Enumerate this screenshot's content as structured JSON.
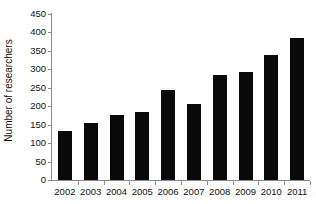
{
  "chart_data": {
    "type": "bar",
    "title": "",
    "subtitle": "",
    "xlabel": "",
    "ylabel": "Number of researchers",
    "categories": [
      "2002",
      "2003",
      "2004",
      "2005",
      "2006",
      "2007",
      "2008",
      "2009",
      "2010",
      "2011"
    ],
    "values": [
      133,
      154,
      175,
      183,
      245,
      206,
      285,
      294,
      340,
      386
    ],
    "series": [
      {
        "name": "Number of researchers",
        "values": [
          133,
          154,
          175,
          183,
          245,
          206,
          285,
          294,
          340,
          386
        ]
      }
    ],
    "ylim": [
      0,
      450
    ],
    "ytick_labels": [
      "0",
      "50",
      "100",
      "150",
      "200",
      "250",
      "300",
      "350",
      "400",
      "450"
    ],
    "ytick_values": [
      0,
      50,
      100,
      150,
      200,
      250,
      300,
      350,
      400,
      450
    ],
    "ytick_step": 50,
    "grid": false,
    "legend": false,
    "legend_position": "none",
    "bar_color": "#0a0a0a",
    "axis_color": "#8a8a8a",
    "background_color": "#ffffff",
    "annotations": []
  }
}
